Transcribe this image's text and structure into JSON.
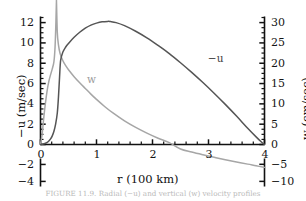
{
  "figure": {
    "caption": "FIGURE 11.9.  Radial (−u) and vertical (w) velocity profiles",
    "colors": {
      "u_curve": "#555555",
      "w_curve": "#a6a6a6",
      "axis": "#111111",
      "background": "#ffffff"
    }
  },
  "chart_data": {
    "type": "line",
    "title": "",
    "subtitle": "",
    "xlabel": "r (100 km)",
    "xlim": [
      0,
      4
    ],
    "x_ticks": [
      0,
      1,
      2,
      3,
      4
    ],
    "x_tick_labels": [
      "0",
      "1",
      "2",
      "3",
      "4"
    ],
    "x_minor_step": 0.2,
    "grid": false,
    "legend_position": "inline-annotation",
    "axes": [
      {
        "id": "left",
        "label": "−u (m/sec)",
        "side": "left",
        "ylim": [
          0,
          12.6
        ],
        "ticks": [
          0,
          2,
          4,
          6,
          8,
          10,
          12
        ],
        "tick_labels": [
          "0",
          "2",
          "4",
          "6",
          "8",
          "10",
          "12"
        ],
        "minor_step": 0.5,
        "broken_segment": {
          "ylim": [
            -4.6,
            -1.3
          ],
          "ticks": [
            -2,
            -4
          ],
          "tick_labels": [
            "−2",
            "−4"
          ]
        }
      },
      {
        "id": "right",
        "label": "w (cm/sec)",
        "side": "right",
        "ylim": [
          0,
          31.5
        ],
        "ticks": [
          0,
          5,
          10,
          15,
          20,
          25,
          30
        ],
        "tick_labels": [
          "0",
          "5",
          "10",
          "15",
          "20",
          "25",
          "30"
        ],
        "minor_step": 1.25,
        "broken_segment": {
          "ylim": [
            -11.5,
            -3.3
          ],
          "ticks": [
            -5,
            -10
          ],
          "tick_labels": [
            "−5",
            "−10"
          ]
        }
      }
    ],
    "series": [
      {
        "name": "−u",
        "annotation_label": "−u",
        "axis": "left",
        "units": "m/sec",
        "color": "#555555",
        "x": [
          0.0,
          0.05,
          0.1,
          0.14,
          0.18,
          0.21,
          0.24,
          0.27,
          0.3,
          0.32,
          0.34,
          0.36,
          0.4,
          0.45,
          0.5,
          0.6,
          0.7,
          0.8,
          0.9,
          1.0,
          1.1,
          1.2,
          1.25,
          1.35,
          1.5,
          1.7,
          1.9,
          2.1,
          2.3,
          2.5,
          2.7,
          2.9,
          3.1,
          3.3,
          3.5,
          3.7,
          3.85,
          3.95,
          4.0
        ],
        "y": [
          0.0,
          0.05,
          0.15,
          0.3,
          0.55,
          0.85,
          1.3,
          2.0,
          3.1,
          4.6,
          6.6,
          8.3,
          9.1,
          9.6,
          9.95,
          10.55,
          11.05,
          11.45,
          11.75,
          11.95,
          12.08,
          12.12,
          12.1,
          12.0,
          11.7,
          11.15,
          10.5,
          9.75,
          8.95,
          8.05,
          7.1,
          6.1,
          5.05,
          3.95,
          2.8,
          1.6,
          0.75,
          0.22,
          0.0
        ],
        "annotation_at": {
          "x": 3.06,
          "y": 8.5
        }
      },
      {
        "name": "w",
        "annotation_label": "w",
        "axis": "right",
        "units": "cm/sec",
        "color": "#a6a6a6",
        "note": "peak clipped above top of plot box near r = 0.28",
        "x": [
          0.0,
          0.03,
          0.06,
          0.09,
          0.12,
          0.15,
          0.18,
          0.21,
          0.24,
          0.26,
          0.275,
          0.285,
          0.285,
          0.3,
          0.32,
          0.35,
          0.4,
          0.45,
          0.5,
          0.6,
          0.7,
          0.8,
          0.9,
          1.0,
          1.15,
          1.3,
          1.5,
          1.7,
          1.9,
          2.1,
          2.3,
          2.5,
          2.7,
          2.9,
          3.1,
          3.3,
          3.5,
          3.7,
          3.85,
          4.0
        ],
        "y": [
          0.0,
          2.6,
          6.8,
          10.4,
          13.4,
          15.6,
          17.2,
          18.6,
          20.4,
          24.0,
          30.0,
          35.5,
          35.5,
          27.6,
          24.6,
          22.4,
          20.6,
          19.4,
          18.4,
          16.7,
          15.2,
          13.8,
          12.4,
          11.1,
          9.3,
          7.7,
          5.8,
          4.2,
          2.8,
          1.55,
          0.45,
          -0.5,
          -1.4,
          -2.2,
          -2.95,
          -3.65,
          -4.3,
          -4.95,
          -5.4,
          -5.9
        ],
        "annotation_at": {
          "x": 0.9,
          "y": 16.2
        }
      }
    ]
  }
}
